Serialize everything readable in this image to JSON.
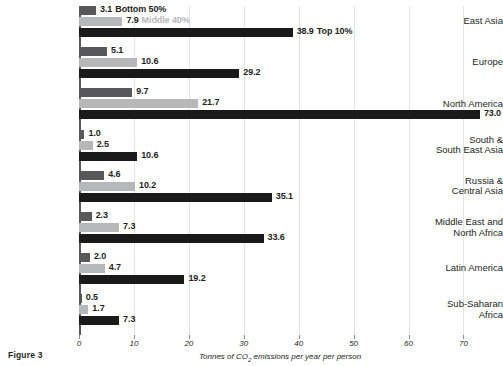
{
  "figure": {
    "label": "Figure 3"
  },
  "chart_data": {
    "type": "bar",
    "orientation": "horizontal",
    "title": "",
    "xlabel": "Tonnes of CO2 emissions per year per person",
    "ylabel": "",
    "xlim": [
      0,
      73.2
    ],
    "xticks": [
      0,
      10,
      20,
      30,
      40,
      50,
      60,
      70
    ],
    "xtick_labels": [
      "0",
      "10",
      "20",
      "30",
      "40",
      "50",
      "60",
      "70"
    ],
    "grid": "vertical",
    "legend_position": "inline-first-group",
    "categories": [
      "East Asia",
      "Europe",
      "North America",
      "South &\nSouth East Asia",
      "Russia &\nCentral Asia",
      "Middle East and\nNorth Africa",
      "Latin America",
      "Sub-Saharan\nAfrica"
    ],
    "series": [
      {
        "name": "Bottom 50%",
        "color": "#58585a",
        "values": [
          3.1,
          5.1,
          9.7,
          1.0,
          4.6,
          2.3,
          2.0,
          0.5
        ],
        "value_labels": [
          "3.1",
          "5.1",
          "9.7",
          "1.0",
          "4.6",
          "2.3",
          "2.0",
          "0.5"
        ]
      },
      {
        "name": "Middle 40%",
        "color": "#b6b7b9",
        "values": [
          7.9,
          10.6,
          21.7,
          2.5,
          10.2,
          7.3,
          4.7,
          1.7
        ],
        "value_labels": [
          "7.9",
          "10.6",
          "21.7",
          "2.5",
          "10.2",
          "7.3",
          "4.7",
          "1.7"
        ]
      },
      {
        "name": "Top 10%",
        "color": "#1a1a1a",
        "values": [
          38.9,
          29.2,
          73.0,
          10.6,
          35.1,
          33.6,
          19.2,
          7.3
        ],
        "value_labels": [
          "38.9",
          "29.2",
          "73.0",
          "10.6",
          "35.1",
          "33.6",
          "19.2",
          "7.3"
        ]
      }
    ],
    "legend": [
      {
        "label": "Bottom 50%",
        "color": "#58585a"
      },
      {
        "label": "Middle 40%",
        "color": "#b6b7b9"
      },
      {
        "label": "Top 10%",
        "color": "#1a1a1a"
      }
    ]
  }
}
